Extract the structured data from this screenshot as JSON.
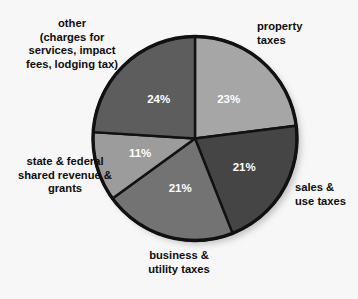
{
  "background_color": "#f7f7f7",
  "chart_data": {
    "type": "pie",
    "title": "",
    "subtitle": "",
    "xlabel": "",
    "ylabel": "",
    "legend_position": "callout-labels",
    "grid": false,
    "units": "percent",
    "total": 100,
    "start_angle_deg": 0,
    "direction": "clockwise",
    "categories": [
      "property taxes",
      "sales & use taxes",
      "business & utility taxes",
      "state & federal shared revenue & grants",
      "other (charges for services, impact fees, lodging tax)"
    ],
    "values": [
      23,
      21,
      21,
      11,
      24
    ],
    "data_labels": [
      "23%",
      "21%",
      "21%",
      "11%",
      "24%"
    ],
    "colors": [
      "#a6a6a6",
      "#454545",
      "#737373",
      "#9c9c9c",
      "#5d5d5d"
    ],
    "slices": [
      {
        "label": "property taxes",
        "value": 23,
        "data_label": "23%",
        "color": "#a6a6a6",
        "label_lines": [
          "property",
          "taxes"
        ],
        "label_align": "left"
      },
      {
        "label": "sales & use taxes",
        "value": 21,
        "data_label": "21%",
        "color": "#454545",
        "label_lines": [
          "sales &",
          "use taxes"
        ],
        "label_align": "left"
      },
      {
        "label": "business & utility taxes",
        "value": 21,
        "data_label": "21%",
        "color": "#737373",
        "label_lines": [
          "business &",
          "utility taxes"
        ],
        "label_align": "center"
      },
      {
        "label": "state & federal shared revenue & grants",
        "value": 11,
        "data_label": "11%",
        "color": "#9c9c9c",
        "label_lines": [
          "state & federal",
          "shared revenue &",
          "grants"
        ],
        "label_align": "center"
      },
      {
        "label": "other (charges for services, impact fees, lodging tax)",
        "value": 24,
        "data_label": "24%",
        "color": "#5d5d5d",
        "label_lines": [
          "other",
          "(charges for",
          "services, impact",
          "fees, lodging tax)"
        ],
        "label_align": "center"
      }
    ]
  },
  "labels": {
    "other": "other\n(charges for\nservices, impact\nfees, lodging tax)",
    "property": "property\ntaxes",
    "sales": "sales &\nuse taxes",
    "business": "business &\nutility taxes",
    "state": "state & federal\nshared revenue &\ngrants"
  },
  "percent_labels": {
    "property": "23%",
    "sales": "21%",
    "business": "21%",
    "state": "11%",
    "other": "24%"
  }
}
